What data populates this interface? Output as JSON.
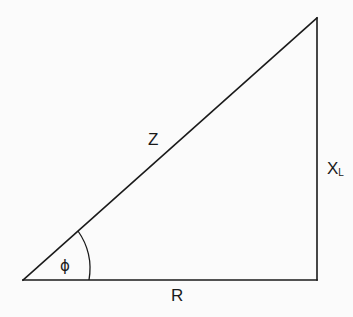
{
  "diagram": {
    "type": "impedance-triangle",
    "labels": {
      "hypotenuse": "Z",
      "base": "R",
      "vertical_main": "X",
      "vertical_sub": "L",
      "angle": "ϕ"
    },
    "vertices": {
      "bottom_left": [
        23,
        280
      ],
      "bottom_right": [
        317,
        280
      ],
      "top_right": [
        317,
        18
      ]
    },
    "colors": {
      "line": "#1a1a1a",
      "background": "#fbfbfb"
    }
  }
}
